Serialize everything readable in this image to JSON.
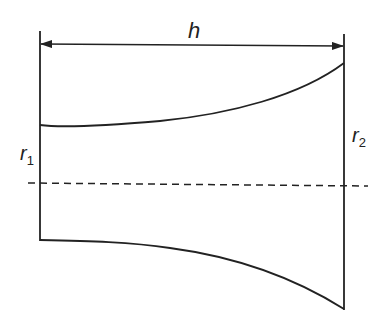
{
  "diagram": {
    "title": "",
    "labels": {
      "length": "h",
      "radius_start": "r",
      "radius_start_sub": "1",
      "radius_end": "r",
      "radius_end_sub": "2"
    },
    "colors": {
      "stroke": "#222222",
      "background": "#ffffff"
    },
    "elements": [
      {
        "id": "left-edge",
        "type": "vertical-line"
      },
      {
        "id": "right-edge",
        "type": "vertical-line"
      },
      {
        "id": "dimension-arrow-h",
        "type": "double-arrow"
      },
      {
        "id": "top-profile-curve",
        "type": "curve",
        "description": "flaring upward toward right"
      },
      {
        "id": "bottom-profile-curve",
        "type": "curve",
        "description": "flaring downward toward right"
      },
      {
        "id": "axis-centerline",
        "type": "dashed-line"
      }
    ]
  }
}
